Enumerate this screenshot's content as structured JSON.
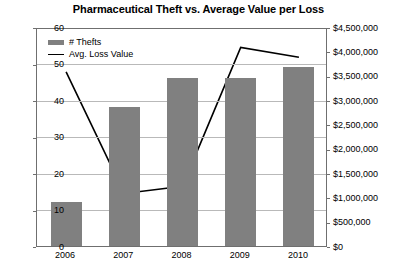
{
  "chart_data": {
    "type": "bar",
    "title": "Pharmaceutical Theft vs. Average Value per Loss",
    "xlabel": "",
    "ylabel": "",
    "categories": [
      "2006",
      "2007",
      "2008",
      "2009",
      "2010"
    ],
    "grid": true,
    "legend_position": "top-left",
    "series": [
      {
        "name": "# Thefts",
        "type": "bar",
        "axis": "left",
        "color": "#808080",
        "values": [
          12,
          38,
          46,
          46,
          49
        ]
      },
      {
        "name": "Avg. Loss Value",
        "type": "line",
        "axis": "right",
        "color": "#000000",
        "values": [
          3600000,
          1100000,
          1250000,
          4100000,
          3900000
        ]
      }
    ],
    "left_axis": {
      "min": 0,
      "max": 60,
      "step": 10,
      "ticks": [
        "0",
        "10",
        "20",
        "30",
        "40",
        "50",
        "60"
      ]
    },
    "right_axis": {
      "min": 0,
      "max": 4500000,
      "step": 500000,
      "ticks": [
        "$0",
        "$500,000",
        "$1,000,000",
        "$1,500,000",
        "$2,000,000",
        "$2,500,000",
        "$3,000,000",
        "$3,500,000",
        "$4,000,000",
        "$4,500,000"
      ]
    }
  },
  "legend": {
    "items": [
      {
        "label": "# Thefts",
        "marker": "bar-swatch-icon"
      },
      {
        "label": "Avg. Loss Value",
        "marker": "line-swatch-icon"
      }
    ]
  },
  "caption": ""
}
